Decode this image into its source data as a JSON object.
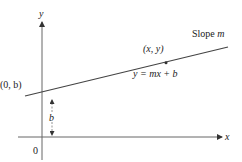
{
  "diagram": {
    "type": "slope-intercept line graph",
    "axes": {
      "x_label": "x",
      "y_label": "y",
      "origin_label": "0"
    },
    "line": {
      "slope_label_prefix": "Slope ",
      "slope_symbol": "m",
      "equation": "y = mx + b"
    },
    "points": {
      "intercept_label": "(0, b)",
      "general_point_label": "(x, y)"
    },
    "intercept_distance_label": "b",
    "colors": {
      "axis": "#555555",
      "line": "#444444",
      "text": "#222222",
      "background": "#ffffff"
    }
  }
}
